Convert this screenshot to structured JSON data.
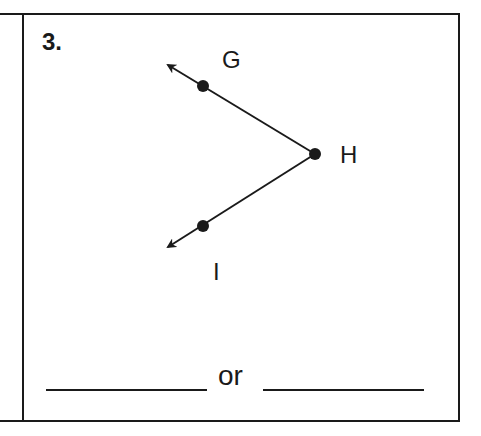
{
  "problem": {
    "number": "3.",
    "points": {
      "G": {
        "label": "G",
        "x": 203,
        "y": 86
      },
      "H": {
        "label": "H",
        "x": 315,
        "y": 154
      },
      "I": {
        "label": "I",
        "x": 203,
        "y": 226
      }
    },
    "figure": "angle with vertex H and rays HG and HI",
    "answer_separator": "or",
    "answer_blanks": [
      "",
      ""
    ]
  },
  "colors": {
    "ink": "#1a1a1a",
    "paper": "#ffffff"
  }
}
